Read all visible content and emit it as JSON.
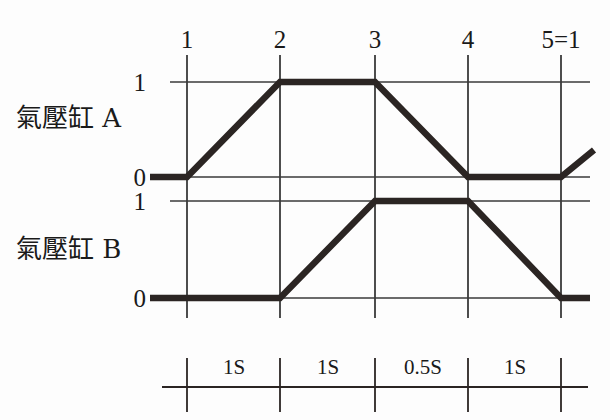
{
  "figure": {
    "type": "timing-diagram",
    "background_color": "#fdfdfd",
    "line_color": "#2b2523",
    "grid_color": "#3a3a3a"
  },
  "steps": {
    "labels": [
      "1",
      "2",
      "3",
      "4",
      "5=1"
    ],
    "x_positions": [
      187,
      280,
      375,
      468,
      561
    ]
  },
  "channels": [
    {
      "name": "氣壓缸 A",
      "level_labels": {
        "high": "1",
        "low": "0"
      },
      "y_high": 82,
      "y_low": 177,
      "points": [
        [
          150,
          177
        ],
        [
          187,
          177
        ],
        [
          280,
          82
        ],
        [
          375,
          82
        ],
        [
          468,
          177
        ],
        [
          561,
          177
        ],
        [
          594,
          150
        ]
      ]
    },
    {
      "name": "氣壓缸 B",
      "level_labels": {
        "high": "1",
        "low": "0"
      },
      "y_high": 201,
      "y_low": 298,
      "points": [
        [
          150,
          298
        ],
        [
          280,
          298
        ],
        [
          375,
          201
        ],
        [
          468,
          201
        ],
        [
          561,
          298
        ],
        [
          590,
          298
        ]
      ]
    }
  ],
  "timescale": {
    "segments": [
      "1S",
      "1S",
      "0.5S",
      "1S"
    ],
    "tick_x": [
      187,
      280,
      375,
      468,
      561
    ],
    "axis_y": 387
  },
  "chart_data": {
    "type": "line",
    "title": "",
    "xlabel": "",
    "ylabel": "",
    "x": [
      1,
      2,
      3,
      4,
      5
    ],
    "xtick_labels": [
      "1",
      "2",
      "3",
      "4",
      "5=1"
    ],
    "grid": true,
    "legend": "none",
    "series": [
      {
        "name": "氣壓缸 A",
        "values": [
          0,
          1,
          1,
          0,
          0
        ],
        "ylim": [
          0,
          1
        ],
        "ytick_labels": [
          "0",
          "1"
        ]
      },
      {
        "name": "氣壓缸 B",
        "values": [
          0,
          0,
          1,
          1,
          0
        ],
        "ylim": [
          0,
          1
        ],
        "ytick_labels": [
          "0",
          "1"
        ]
      }
    ],
    "interval_durations": [
      "1S",
      "1S",
      "0.5S",
      "1S"
    ]
  }
}
